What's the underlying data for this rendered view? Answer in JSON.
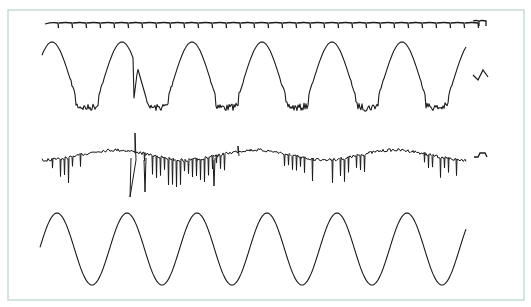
{
  "frame": {
    "border_color": "#c7dbd6",
    "background": "#ffffff",
    "x": 8,
    "y": 10,
    "width": 516,
    "height": 290
  },
  "stroke_color": "#1a1a1a",
  "chart_data": {
    "type": "line",
    "title": "",
    "xlabel": "",
    "ylabel": "",
    "grid": false,
    "legend": "none",
    "series": [
      {
        "name": "trace-1-periodic-ticks",
        "description": "flat baseline with regularly spaced small downward cusps",
        "x_range": [
          45,
          467
        ],
        "baseline_y": 23,
        "tick_spacing": 14,
        "tick_depth": 5,
        "legend_sample": "small tick pair"
      },
      {
        "name": "trace-2-noisy-wave",
        "description": "quasi-sinusoidal wave with jagged troughs, ~6 cycles",
        "x_range": [
          42,
          466
        ],
        "peaks_x": [
          50,
          122,
          192,
          262,
          333,
          402
        ],
        "peak_y": 42,
        "trough_y": 112,
        "period": 70,
        "legend_sample": "small zigzag"
      },
      {
        "name": "trace-3-spiky-signal",
        "description": "noisy signal with dense downward spikes, slow 3-cycle undulation",
        "x_range": [
          42,
          466
        ],
        "baseline_y": 155,
        "max_spike_down_y": 197,
        "max_spike_up_y": 133,
        "undulation_period": 140,
        "legend_sample": "small step bump"
      },
      {
        "name": "trace-4-pure-sine",
        "description": "clean sinusoid, 6 cycles",
        "x_range": [
          40,
          466
        ],
        "center_y": 249,
        "amplitude": 36,
        "period": 70,
        "first_peak_x": 57
      }
    ]
  }
}
